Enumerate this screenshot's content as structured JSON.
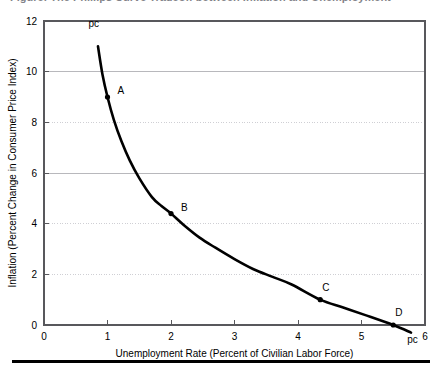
{
  "figure": {
    "clipped_heading": "Figure: The Phillips Curve Tradeoff between Inflation and Unemployment",
    "bottom_rule": "horizontal-rule"
  },
  "chart_data": {
    "type": "line",
    "title": "",
    "xlabel": "Unemployment Rate (Percent of Civilian Labor Force)",
    "ylabel": "Inflation (Percent Change in Consumer Price Index)",
    "xlim": [
      0,
      6
    ],
    "ylim": [
      0,
      12
    ],
    "xticks": [
      0,
      1,
      2,
      3,
      4,
      5,
      6
    ],
    "xticklabels": [
      "0",
      "1",
      "2",
      "3",
      "4",
      "5",
      "6"
    ],
    "yticks": [
      0,
      2,
      4,
      6,
      8,
      10,
      12
    ],
    "yticklabels": [
      "0",
      "2",
      "4",
      "6",
      "8",
      "10",
      "12"
    ],
    "grid": "horizontal-only",
    "gridlines": [
      {
        "value": 10,
        "style": "solid"
      },
      {
        "value": 8,
        "style": "dotted"
      },
      {
        "value": 6,
        "style": "solid"
      },
      {
        "value": 4,
        "style": "dotted"
      },
      {
        "value": 2,
        "style": "dotted"
      }
    ],
    "legend": "none",
    "series": [
      {
        "name": "pc",
        "label": "pc",
        "color": "#000000",
        "x": [
          0.85,
          0.92,
          1.0,
          1.1,
          1.22,
          1.35,
          1.5,
          1.7,
          1.85,
          2.0,
          2.2,
          2.45,
          2.7,
          3.0,
          3.3,
          3.6,
          3.9,
          4.35,
          4.7,
          5.05,
          5.5,
          5.78
        ],
        "y": [
          11.0,
          9.9,
          9.0,
          8.1,
          7.25,
          6.5,
          5.8,
          5.05,
          4.7,
          4.4,
          3.95,
          3.45,
          3.05,
          2.6,
          2.2,
          1.9,
          1.6,
          1.0,
          0.7,
          0.4,
          0.0,
          -0.3
        ]
      }
    ],
    "points": [
      {
        "label": "A",
        "x": 1.0,
        "y": 9.0,
        "label_dx": 10,
        "label_dy": -3
      },
      {
        "label": "B",
        "x": 2.0,
        "y": 4.4,
        "label_dx": 10,
        "label_dy": -3
      },
      {
        "label": "C",
        "x": 4.35,
        "y": 1.0,
        "label_dx": 2,
        "label_dy": -9
      },
      {
        "label": "D",
        "x": 5.5,
        "y": 0.0,
        "label_dx": 2,
        "label_dy": -9
      }
    ],
    "annotations": [
      {
        "text": "pc",
        "x": 0.7,
        "y": 11.75,
        "name": "curve-label-top"
      },
      {
        "text": "pc",
        "x": 5.72,
        "y": -0.72,
        "name": "curve-label-bottom"
      }
    ]
  },
  "colors": {
    "curve": "#000000",
    "frame": "#58585c",
    "grid_solid": "#b8b8bc",
    "grid_dotted": "#cfcfd4",
    "text": "#000000",
    "rule": "#000000"
  }
}
